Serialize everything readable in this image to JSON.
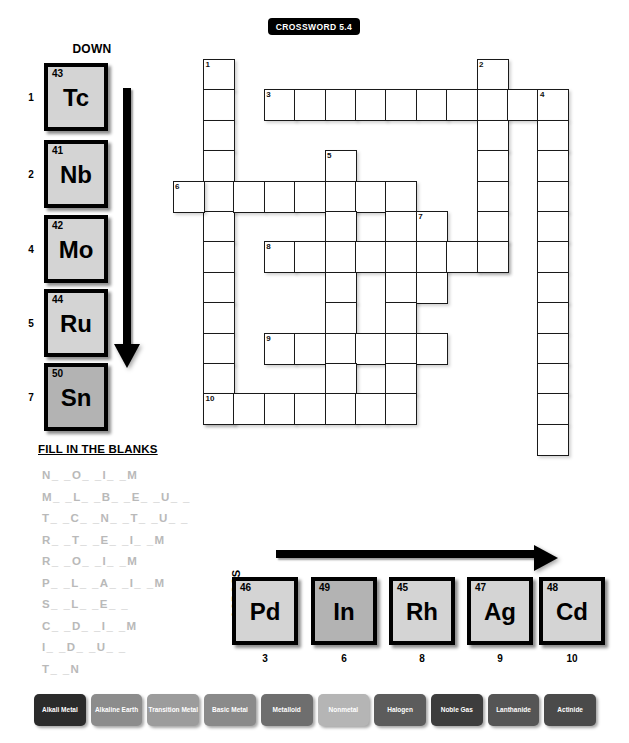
{
  "title": "CROSSWORD  5.4",
  "down": {
    "label": "DOWN",
    "arrow_icon": "arrow-down-icon",
    "tiles": [
      {
        "clue": "1",
        "number": "43",
        "symbol": "Tc",
        "shade": "light"
      },
      {
        "clue": "2",
        "number": "41",
        "symbol": "Nb",
        "shade": "light"
      },
      {
        "clue": "4",
        "number": "42",
        "symbol": "Mo",
        "shade": "light"
      },
      {
        "clue": "5",
        "number": "44",
        "symbol": "Ru",
        "shade": "light"
      },
      {
        "clue": "7",
        "number": "50",
        "symbol": "Sn",
        "shade": "dark"
      }
    ]
  },
  "across": {
    "label": "ACROSS",
    "arrow_icon": "arrow-right-icon",
    "tiles": [
      {
        "clue": "3",
        "number": "46",
        "symbol": "Pd",
        "shade": "light"
      },
      {
        "clue": "6",
        "number": "49",
        "symbol": "In",
        "shade": "dark"
      },
      {
        "clue": "8",
        "number": "45",
        "symbol": "Rh",
        "shade": "light"
      },
      {
        "clue": "9",
        "number": "47",
        "symbol": "Ag",
        "shade": "light"
      },
      {
        "clue": "10",
        "number": "48",
        "symbol": "Cd",
        "shade": "light"
      }
    ]
  },
  "fill_in_the_blanks": {
    "title": "FILL IN THE BLANKS",
    "lines": [
      "N_ _O_ _I_ _M",
      "M_ _L_ _B_ _E_ _U_ _",
      "T_ _C_ _N_ _T_ _U_ _",
      "R_ _T_ _E_ _I_ _M",
      "R_ _O_ _I_ _M",
      "P_ _L_ _A_ _I_ _M",
      "S_ _L_ _E_ _",
      "C_ _D_ _I_ _M",
      "I_ _D_ _U_ _",
      "T_ _N"
    ]
  },
  "legend": {
    "items": [
      {
        "label": "Alkali Metal",
        "color": "#2b2b2b"
      },
      {
        "label": "Alkaline Earth",
        "color": "#8c8c8c"
      },
      {
        "label": "Transition Metal",
        "color": "#9c9c9c"
      },
      {
        "label": "Basic Metal",
        "color": "#8a8a8a"
      },
      {
        "label": "Metalloid",
        "color": "#6e6e6e"
      },
      {
        "label": "Nonmetal",
        "color": "#b5b5b5"
      },
      {
        "label": "Halogen",
        "color": "#5c5c5c"
      },
      {
        "label": "Noble Gas",
        "color": "#3d3d3d"
      },
      {
        "label": "Lanthanide",
        "color": "#555555"
      },
      {
        "label": "Actinide",
        "color": "#4a4a4a"
      }
    ]
  },
  "grid": {
    "cell_size": 32,
    "origin_x": 203,
    "origin_y": 59,
    "cells": [
      {
        "c": 0,
        "r": 0,
        "n": "1"
      },
      {
        "c": 0,
        "r": 1
      },
      {
        "c": 0,
        "r": 2
      },
      {
        "c": 0,
        "r": 3
      },
      {
        "c": 0,
        "r": 4
      },
      {
        "c": 0,
        "r": 5
      },
      {
        "c": 0,
        "r": 6
      },
      {
        "c": 0,
        "r": 7
      },
      {
        "c": 0,
        "r": 8
      },
      {
        "c": 0,
        "r": 9
      },
      {
        "c": 0,
        "r": 10
      },
      {
        "c": 0,
        "r": 11
      },
      {
        "c": 9,
        "r": 0,
        "n": "2"
      },
      {
        "c": 2,
        "r": 1,
        "n": "3"
      },
      {
        "c": 3,
        "r": 1
      },
      {
        "c": 4,
        "r": 1
      },
      {
        "c": 5,
        "r": 1
      },
      {
        "c": 6,
        "r": 1
      },
      {
        "c": 7,
        "r": 1
      },
      {
        "c": 8,
        "r": 1
      },
      {
        "c": 9,
        "r": 1
      },
      {
        "c": 10,
        "r": 1
      },
      {
        "c": 11,
        "r": 1,
        "n": "4"
      },
      {
        "c": 9,
        "r": 2
      },
      {
        "c": 11,
        "r": 2
      },
      {
        "c": 9,
        "r": 3
      },
      {
        "c": 11,
        "r": 3
      },
      {
        "c": 9,
        "r": 4
      },
      {
        "c": 11,
        "r": 4
      },
      {
        "c": 9,
        "r": 5
      },
      {
        "c": 11,
        "r": 5
      },
      {
        "c": 9,
        "r": 6
      },
      {
        "c": 11,
        "r": 6
      },
      {
        "c": 11,
        "r": 7
      },
      {
        "c": 11,
        "r": 8
      },
      {
        "c": 11,
        "r": 9
      },
      {
        "c": 11,
        "r": 10
      },
      {
        "c": 11,
        "r": 11
      },
      {
        "c": 11,
        "r": 12
      },
      {
        "c": 4,
        "r": 3,
        "n": "5"
      },
      {
        "c": -1,
        "r": 4,
        "n": "6"
      },
      {
        "c": 1,
        "r": 4
      },
      {
        "c": 2,
        "r": 4
      },
      {
        "c": 3,
        "r": 4
      },
      {
        "c": 4,
        "r": 4
      },
      {
        "c": 5,
        "r": 4
      },
      {
        "c": 6,
        "r": 4
      },
      {
        "c": 4,
        "r": 5
      },
      {
        "c": 6,
        "r": 5
      },
      {
        "c": 7,
        "r": 5,
        "n": "7"
      },
      {
        "c": 2,
        "r": 6,
        "n": "8"
      },
      {
        "c": 3,
        "r": 6
      },
      {
        "c": 4,
        "r": 6
      },
      {
        "c": 5,
        "r": 6
      },
      {
        "c": 6,
        "r": 6
      },
      {
        "c": 7,
        "r": 6
      },
      {
        "c": 8,
        "r": 6
      },
      {
        "c": 9,
        "r": 6
      },
      {
        "c": 4,
        "r": 7
      },
      {
        "c": 6,
        "r": 7
      },
      {
        "c": 7,
        "r": 7
      },
      {
        "c": 4,
        "r": 8
      },
      {
        "c": 6,
        "r": 8
      },
      {
        "c": 2,
        "r": 9,
        "n": "9"
      },
      {
        "c": 3,
        "r": 9
      },
      {
        "c": 4,
        "r": 9
      },
      {
        "c": 5,
        "r": 9
      },
      {
        "c": 6,
        "r": 9
      },
      {
        "c": 7,
        "r": 9
      },
      {
        "c": 4,
        "r": 10
      },
      {
        "c": 6,
        "r": 10
      },
      {
        "c": 0,
        "r": 11,
        "n": "10"
      },
      {
        "c": 1,
        "r": 11
      },
      {
        "c": 2,
        "r": 11
      },
      {
        "c": 3,
        "r": 11
      },
      {
        "c": 4,
        "r": 11
      },
      {
        "c": 5,
        "r": 11
      },
      {
        "c": 6,
        "r": 11
      }
    ]
  }
}
